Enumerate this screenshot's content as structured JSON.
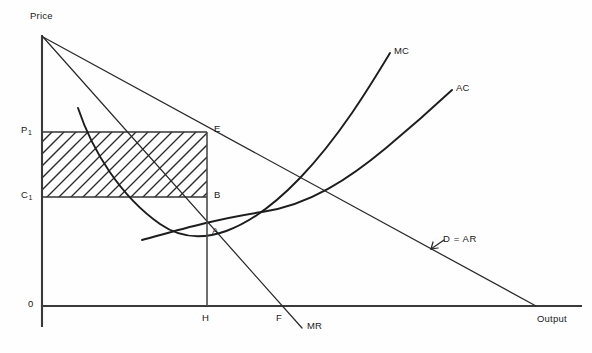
{
  "figure": {
    "type": "economics-diagram",
    "topic": "monopoly-profit-maximisation",
    "axes": {
      "y_label": "Price",
      "x_label": "Output",
      "origin_label": "0"
    },
    "price_levels": {
      "p1_label": "P",
      "p1_sub": "1",
      "c1_label": "C",
      "c1_sub": "1"
    },
    "points": [
      {
        "name": "E",
        "label": "E",
        "role": "price-on-demand-curve"
      },
      {
        "name": "B",
        "label": "B",
        "role": "cost-on-average-cost-curve"
      },
      {
        "name": "A",
        "label": "A",
        "role": "mr-equals-mc"
      },
      {
        "name": "H",
        "label": "H",
        "role": "equilibrium-output-on-x-axis"
      },
      {
        "name": "F",
        "label": "F",
        "role": "mr-x-axis-intercept"
      }
    ],
    "curves": [
      {
        "name": "MC",
        "label": "MC",
        "description": "marginal-cost-curve"
      },
      {
        "name": "AC",
        "label": "AC",
        "description": "average-cost-curve"
      },
      {
        "name": "MR",
        "label": "MR",
        "description": "marginal-revenue-line"
      },
      {
        "name": "D_AR",
        "label": "D = AR",
        "description": "demand-average-revenue-line"
      }
    ],
    "shaded_region": {
      "name": "supernormal-profit",
      "pattern": "diagonal-hatching",
      "corners": [
        "P1",
        "E",
        "B",
        "C1"
      ]
    },
    "colors": {
      "background": "#fefefe",
      "ink": "#1d1d1d",
      "axis": "#3a3a3a"
    }
  }
}
